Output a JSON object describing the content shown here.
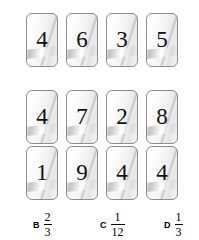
{
  "problem": {
    "card_rows": [
      {
        "row_label": "row-1",
        "digits": [
          "4",
          "6",
          "3",
          "5"
        ]
      },
      {
        "row_label": "row-2",
        "digits": [
          "4",
          "7",
          "2",
          "8"
        ]
      },
      {
        "row_label": "row-3",
        "digits": [
          "1",
          "9",
          "4",
          "4"
        ]
      }
    ],
    "choices": [
      {
        "letter": "B",
        "numerator": "2",
        "denominator": "3"
      },
      {
        "letter": "C",
        "numerator": "1",
        "denominator": "12"
      },
      {
        "letter": "D",
        "numerator": "1",
        "denominator": "3"
      }
    ]
  },
  "colors": {
    "card_border": "#8d8d8d",
    "digit": "#111111",
    "text": "#000000",
    "background": "#ffffff"
  }
}
